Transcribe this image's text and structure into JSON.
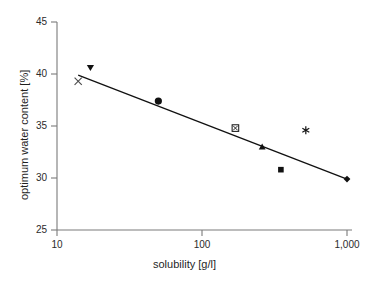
{
  "chart_data": {
    "type": "scatter",
    "title": "",
    "xlabel": "solubility [g/l]",
    "ylabel": "optimum water content [%]",
    "xscale": "log",
    "yscale": "linear",
    "xlim": [
      10,
      1000
    ],
    "ylim": [
      25,
      45
    ],
    "grid": false,
    "legend": null,
    "xticks": [
      {
        "value": 10,
        "label": "10"
      },
      {
        "value": 100,
        "label": "100"
      },
      {
        "value": 1000,
        "label": "1,000"
      }
    ],
    "yticks": [
      {
        "value": 45,
        "label": "45"
      },
      {
        "value": 40,
        "label": "40"
      },
      {
        "value": 35,
        "label": "35"
      },
      {
        "value": 30,
        "label": "30"
      },
      {
        "value": 25,
        "label": "25"
      }
    ],
    "points": [
      {
        "x": 14,
        "y": 39.3,
        "marker": "x",
        "filled": false
      },
      {
        "x": 17,
        "y": 40.6,
        "marker": "triangle-down",
        "filled": true
      },
      {
        "x": 50,
        "y": 37.4,
        "marker": "circle",
        "filled": true
      },
      {
        "x": 170,
        "y": 34.8,
        "marker": "square-x",
        "filled": false
      },
      {
        "x": 260,
        "y": 33.0,
        "marker": "triangle-up",
        "filled": true
      },
      {
        "x": 350,
        "y": 30.8,
        "marker": "square",
        "filled": true
      },
      {
        "x": 520,
        "y": 34.6,
        "marker": "asterisk",
        "filled": true
      },
      {
        "x": 1000,
        "y": 29.9,
        "marker": "diamond",
        "filled": true
      }
    ],
    "trendline": {
      "type": "log-linear-fit",
      "x_start": 14,
      "y_start": 39.9,
      "x_end": 1000,
      "y_end": 29.9
    },
    "colors": {
      "axis": "#7a7a7a",
      "marker": "#111111",
      "line": "#111111",
      "text": "#2b2b2b",
      "background": "#ffffff"
    }
  }
}
